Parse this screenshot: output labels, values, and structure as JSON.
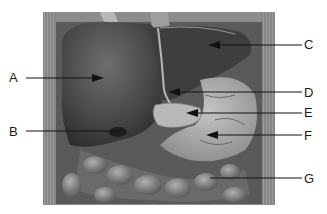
{
  "figure": {
    "type": "anatomical-illustration",
    "style": "grayscale engraving"
  },
  "labels": [
    {
      "id": "A",
      "text": "A",
      "side": "left",
      "label_x": 14,
      "label_y": 78,
      "tip_x": 102,
      "tip_y": 78,
      "organ": "liver"
    },
    {
      "id": "B",
      "text": "B",
      "side": "left",
      "label_x": 14,
      "label_y": 132,
      "tip_x": 118,
      "tip_y": 131,
      "organ": "gallbladder"
    },
    {
      "id": "C",
      "text": "C",
      "side": "right",
      "label_x": 307,
      "label_y": 45,
      "tip_x": 210,
      "tip_y": 45,
      "organ": "left lobe of liver"
    },
    {
      "id": "D",
      "text": "D",
      "side": "right",
      "label_x": 307,
      "label_y": 93,
      "tip_x": 170,
      "tip_y": 92,
      "organ": "ligament"
    },
    {
      "id": "E",
      "text": "E",
      "side": "right",
      "label_x": 307,
      "label_y": 113,
      "tip_x": 190,
      "tip_y": 113,
      "organ": "pancreas"
    },
    {
      "id": "F",
      "text": "F",
      "side": "right",
      "label_x": 307,
      "label_y": 136,
      "tip_x": 208,
      "tip_y": 135,
      "organ": "stomach"
    },
    {
      "id": "G",
      "text": "G",
      "side": "right",
      "label_x": 307,
      "label_y": 179,
      "tip_x": 210,
      "tip_y": 178,
      "organ": "large intestine"
    }
  ],
  "colors": {
    "background": "#ffffff",
    "ink": "#1a1a1a",
    "body_wall": "#8a8a8a",
    "liver": "#4a4a4a",
    "liver_light": "#6b6b6b",
    "stomach": "#a8a8a8",
    "intestine": "#7a7a7a",
    "pancreas": "#b5b5b5"
  }
}
